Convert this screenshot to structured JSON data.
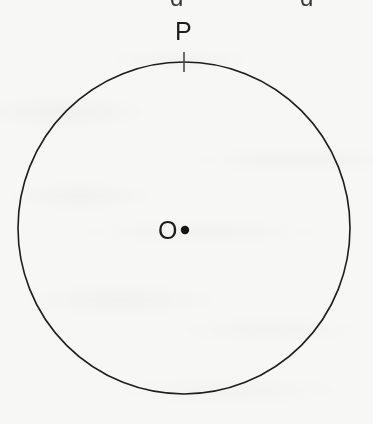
{
  "figure": {
    "kind": "circle-geometry-diagram",
    "canvas": {
      "width": 373,
      "height": 424
    },
    "background_color": "#f7f7f6",
    "ink_color": "#1d1d1d",
    "circle": {
      "center_x": 184,
      "center_y": 228,
      "radius": 166,
      "stroke_color": "#1d1d1d",
      "stroke_width": 1.6,
      "fill": "none"
    },
    "center_point": {
      "label": "O",
      "dot_x": 185,
      "dot_y": 230,
      "dot_radius": 4.2,
      "dot_color": "#141414",
      "label_x": 158,
      "label_y": 218,
      "font_size": 25
    },
    "perimeter_point": {
      "label": "P",
      "tick_x": 184,
      "tick_top_y": 52,
      "tick_bottom_y": 72,
      "tick_color": "#4a4a4a",
      "tick_width": 1.6,
      "label_x": 175,
      "label_y": 19,
      "font_size": 25
    },
    "clipped_text_row": {
      "note": "bottoms of glyphs from a text line cut off by the top crop edge",
      "glyphs": [
        {
          "char": "g",
          "x": 170
        },
        {
          "char": "g",
          "x": 300
        }
      ]
    }
  }
}
